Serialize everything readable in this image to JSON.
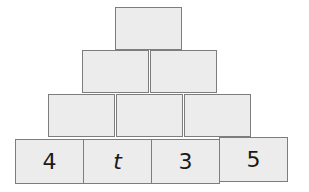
{
  "pyramid": {
    "rows": [
      {
        "cells": [
          ""
        ]
      },
      {
        "cells": [
          "",
          ""
        ]
      },
      {
        "cells": [
          "",
          "",
          ""
        ]
      },
      {
        "cells": [
          "4",
          "t",
          "3",
          "5"
        ]
      }
    ]
  }
}
